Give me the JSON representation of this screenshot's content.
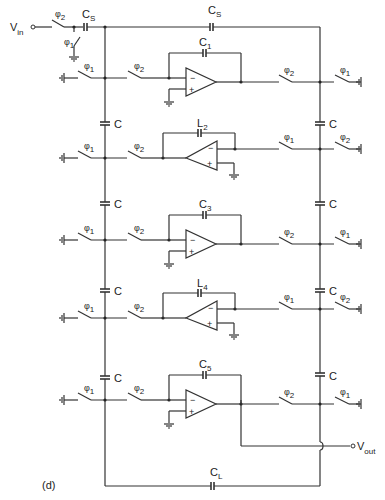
{
  "figure": {
    "label": "(d)",
    "input": {
      "name": "V",
      "sub": "in"
    },
    "output": {
      "name": "V",
      "sub": "out"
    }
  },
  "top": {
    "input_switch": {
      "phi": "φ",
      "sub": "2"
    },
    "ground_switch": {
      "phi": "φ",
      "sub": "1"
    },
    "cs1": {
      "name": "C",
      "sub": "S"
    },
    "cs2": {
      "name": "C",
      "sub": "S"
    }
  },
  "coupling_cap": "C",
  "load_cap": {
    "name": "C",
    "sub": "L"
  },
  "stages": [
    {
      "fb": {
        "name": "C",
        "sub": "1"
      },
      "left_gnd_sw": {
        "phi": "φ",
        "sub": "1"
      },
      "left_sw": {
        "phi": "φ",
        "sub": "2"
      },
      "right_sw": {
        "phi": "φ",
        "sub": "2"
      },
      "right_gnd_sw": {
        "phi": "φ",
        "sub": "1"
      },
      "minus": "−",
      "plus": "+"
    },
    {
      "fb": {
        "name": "L",
        "sub": "2"
      },
      "left_gnd_sw": {
        "phi": "φ",
        "sub": "1"
      },
      "left_sw": {
        "phi": "φ",
        "sub": "2"
      },
      "right_sw": {
        "phi": "φ",
        "sub": "1"
      },
      "right_gnd_sw": {
        "phi": "φ",
        "sub": "2"
      },
      "minus": "−",
      "plus": "+"
    },
    {
      "fb": {
        "name": "C",
        "sub": "3"
      },
      "left_gnd_sw": {
        "phi": "φ",
        "sub": "1"
      },
      "left_sw": {
        "phi": "φ",
        "sub": "2"
      },
      "right_sw": {
        "phi": "φ",
        "sub": "2"
      },
      "right_gnd_sw": {
        "phi": "φ",
        "sub": "1"
      },
      "minus": "−",
      "plus": "+"
    },
    {
      "fb": {
        "name": "L",
        "sub": "4"
      },
      "left_gnd_sw": {
        "phi": "φ",
        "sub": "1"
      },
      "left_sw": {
        "phi": "φ",
        "sub": "2"
      },
      "right_sw": {
        "phi": "φ",
        "sub": "1"
      },
      "right_gnd_sw": {
        "phi": "φ",
        "sub": "2"
      },
      "minus": "−",
      "plus": "+"
    },
    {
      "fb": {
        "name": "C",
        "sub": "5"
      },
      "left_gnd_sw": {
        "phi": "φ",
        "sub": "1"
      },
      "left_sw": {
        "phi": "φ",
        "sub": "2"
      },
      "right_sw": {
        "phi": "φ",
        "sub": "2"
      },
      "right_gnd_sw": {
        "phi": "φ",
        "sub": "1"
      },
      "minus": "−",
      "plus": "+"
    }
  ]
}
